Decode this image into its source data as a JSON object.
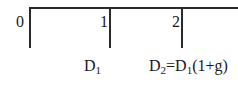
{
  "timeline": {
    "ticks": [
      {
        "label": "0"
      },
      {
        "label": "1"
      },
      {
        "label": "2"
      }
    ],
    "cash_flows": [
      {
        "period": "1",
        "base": "D",
        "sub": "1",
        "expr": ""
      },
      {
        "period": "2",
        "base": "D",
        "sub": "2",
        "expr_eq": "=D",
        "expr_sub": "1",
        "expr_tail": "(1+g)"
      }
    ]
  }
}
